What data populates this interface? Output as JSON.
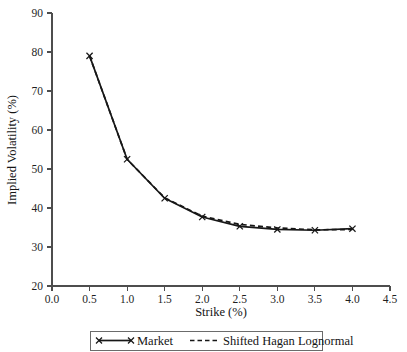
{
  "chart_data": {
    "type": "line",
    "title": "",
    "xlabel": "Strike (%)",
    "ylabel": "Implied Volatility (%)",
    "xlim": [
      0.0,
      4.5
    ],
    "ylim": [
      20,
      90
    ],
    "xticks": [
      "0.0",
      "0.5",
      "1.0",
      "1.5",
      "2.0",
      "2.5",
      "3.0",
      "3.5",
      "4.0",
      "4.5"
    ],
    "yticks": [
      "20",
      "30",
      "40",
      "50",
      "60",
      "70",
      "80",
      "90"
    ],
    "grid": false,
    "legend_position": "below-axis",
    "x": [
      0.5,
      1.0,
      1.5,
      2.0,
      2.5,
      3.0,
      3.5,
      4.0
    ],
    "series": [
      {
        "name": "Market",
        "style": "solid-with-x-markers",
        "values": [
          79.0,
          52.5,
          42.5,
          37.7,
          35.3,
          34.5,
          34.3,
          34.7
        ]
      },
      {
        "name": "Shifted Hagan Lognormal",
        "style": "dashed",
        "values": [
          79.0,
          52.5,
          42.6,
          37.9,
          35.8,
          34.9,
          34.4,
          34.5
        ]
      }
    ]
  },
  "legend": {
    "items": [
      {
        "label": "Market"
      },
      {
        "label": "Shifted Hagan Lognormal"
      }
    ]
  },
  "colors": {
    "line": "#171717",
    "axis": "#4d4d4d",
    "background": "#ffffff"
  }
}
